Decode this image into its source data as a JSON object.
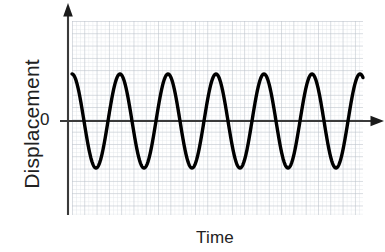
{
  "figure": {
    "name": "displacement-time-wave-graph",
    "background_color": "#ffffff"
  },
  "labels": {
    "ylabel": "Displacement",
    "xlabel": "Time",
    "zero_tick": "0"
  },
  "colors": {
    "curve": "#000000",
    "axis": "#333333",
    "grid_minor": "#d8dde2",
    "grid_major": "#b9c0c7",
    "text": "#222222"
  },
  "chart_data": {
    "type": "line",
    "title": "",
    "xlabel": "Time",
    "ylabel": "Displacement",
    "grid": true,
    "legend": "none",
    "xlim": [
      0,
      6.0625
    ],
    "ylim": [
      -1.55,
      1.55
    ],
    "yticks": [
      0
    ],
    "ytick_labels": [
      "0"
    ],
    "xticks": [],
    "xtick_labels": [],
    "waveform": {
      "function": "cosine",
      "amplitude": 1.0,
      "period": 1.0,
      "cycles": 6.0625,
      "phase": 0,
      "baseline": 0
    },
    "series": [
      {
        "name": "displacement",
        "x": [
          0,
          0.0625,
          0.125,
          0.1875,
          0.25,
          0.3125,
          0.375,
          0.4375,
          0.5,
          0.5625,
          0.625,
          0.6875,
          0.75,
          0.8125,
          0.875,
          0.9375,
          1,
          1.0625,
          1.125,
          1.1875,
          1.25,
          1.3125,
          1.375,
          1.4375,
          1.5,
          1.5625,
          1.625,
          1.6875,
          1.75,
          1.8125,
          1.875,
          1.9375,
          2,
          2.0625,
          2.125,
          2.1875,
          2.25,
          2.3125,
          2.375,
          2.4375,
          2.5,
          2.5625,
          2.625,
          2.6875,
          2.75,
          2.8125,
          2.875,
          2.9375,
          3,
          3.0625,
          3.125,
          3.1875,
          3.25,
          3.3125,
          3.375,
          3.4375,
          3.5,
          3.5625,
          3.625,
          3.6875,
          3.75,
          3.8125,
          3.875,
          3.9375,
          4,
          4.0625,
          4.125,
          4.1875,
          4.25,
          4.3125,
          4.375,
          4.4375,
          4.5,
          4.5625,
          4.625,
          4.6875,
          4.75,
          4.8125,
          4.875,
          4.9375,
          5,
          5.0625,
          5.125,
          5.1875,
          5.25,
          5.3125,
          5.375,
          5.4375,
          5.5,
          5.5625,
          5.625,
          5.6875,
          5.75,
          5.8125,
          5.875,
          5.9375,
          6,
          6.0625
        ],
        "y": [
          1,
          0.924,
          0.707,
          0.383,
          0,
          -0.383,
          -0.707,
          -0.924,
          -1,
          -0.924,
          -0.707,
          -0.383,
          0,
          0.383,
          0.707,
          0.924,
          1,
          0.924,
          0.707,
          0.383,
          0,
          -0.383,
          -0.707,
          -0.924,
          -1,
          -0.924,
          -0.707,
          -0.383,
          0,
          0.383,
          0.707,
          0.924,
          1,
          0.924,
          0.707,
          0.383,
          0,
          -0.383,
          -0.707,
          -0.924,
          -1,
          -0.924,
          -0.707,
          -0.383,
          0,
          0.383,
          0.707,
          0.924,
          1,
          0.924,
          0.707,
          0.383,
          0,
          -0.383,
          -0.707,
          -0.924,
          -1,
          -0.924,
          -0.707,
          -0.383,
          0,
          0.383,
          0.707,
          0.924,
          1,
          0.924,
          0.707,
          0.383,
          0,
          -0.383,
          -0.707,
          -0.924,
          -1,
          -0.924,
          -0.707,
          -0.383,
          0,
          0.383,
          0.707,
          0.924,
          1,
          0.924,
          0.707,
          0.383,
          0,
          -0.383,
          -0.707,
          -0.924,
          -1,
          -0.924,
          -0.707,
          -0.383,
          0,
          0.383,
          0.707,
          0.924,
          1,
          1
        ]
      }
    ]
  },
  "plot_geometry": {
    "grid_left": 72,
    "grid_right": 363,
    "grid_top": 21,
    "grid_bottom": 215,
    "zero_y": 121,
    "peak_y": 74,
    "trough_y": 170,
    "wavelength_px": 48,
    "minor_step_px": 4.1,
    "major_step_px": 12.3,
    "yaxis_x": 68,
    "xaxis_arrow_x": 383
  }
}
